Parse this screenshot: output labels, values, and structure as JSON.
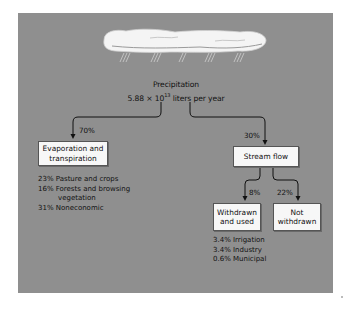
{
  "diagram": {
    "title": "Precipitation",
    "total": "5.88 × 10",
    "total_exponent": "13",
    "total_unit": " liters per year",
    "icon": "rain-cloud-icon",
    "colors": {
      "panel": "#8f8f8f",
      "box": "#f7f7f7",
      "line": "#111111"
    },
    "branches": {
      "left": {
        "percent": "70%",
        "label_line1": "Evaporation and",
        "label_line2": "transpiration",
        "details": [
          {
            "text": "23% Pasture and crops"
          },
          {
            "text": "16% Forests and browsing",
            "continuation": "vegetation"
          },
          {
            "text": "31% Noneconomic"
          }
        ]
      },
      "right": {
        "percent": "30%",
        "label": "Stream flow",
        "children": {
          "withdrawn": {
            "percent": "8%",
            "label_line1": "Withdrawn",
            "label_line2": "and used",
            "details": [
              "3.4% Irrigation",
              "3.4% Industry",
              "0.6% Municipal"
            ]
          },
          "not_withdrawn": {
            "percent": "22%",
            "label_line1": "Not",
            "label_line2": "withdrawn"
          }
        }
      }
    }
  }
}
